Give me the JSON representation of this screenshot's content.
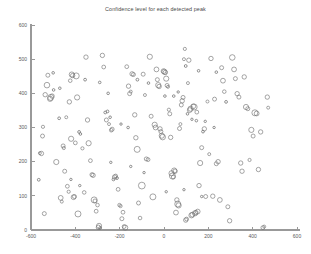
{
  "figure": {
    "title": "Confidence level for each detected peak",
    "background_color": "#ffffff",
    "axis_color": "#999999",
    "marker_color": "#6e6e6e",
    "text_color": "#4a4a4a"
  },
  "chart_data": {
    "type": "scatter",
    "title": "Confidence level for each detected peak",
    "xlabel": "",
    "ylabel": "",
    "xlim": [
      -600,
      600
    ],
    "ylim": [
      0,
      600
    ],
    "xticks": [
      -600,
      -400,
      -200,
      0,
      200,
      400,
      600
    ],
    "yticks": [
      0,
      100,
      200,
      300,
      400,
      500,
      600
    ],
    "xticklabels": [
      "-600",
      "-400",
      "-200",
      "0",
      "200",
      "400",
      "600"
    ],
    "yticklabels": [
      "0",
      "100",
      "200",
      "300",
      "400",
      "500",
      "600"
    ],
    "grid": false,
    "legend": null,
    "marker": "open-circle",
    "size_encodes": "confidence level",
    "size_range": [
      1,
      6
    ],
    "series": [
      {
        "name": "detected peaks",
        "points": [
          {
            "x": -565,
            "y": 147,
            "s": 1.4
          },
          {
            "x": -560,
            "y": 225,
            "s": 1.5
          },
          {
            "x": -553,
            "y": 224,
            "s": 2.2
          },
          {
            "x": -548,
            "y": 275,
            "s": 2.0
          },
          {
            "x": -546,
            "y": 302,
            "s": 1.6
          },
          {
            "x": -540,
            "y": 48,
            "s": 2.0
          },
          {
            "x": -536,
            "y": 396,
            "s": 2.2
          },
          {
            "x": -528,
            "y": 424,
            "s": 2.8
          },
          {
            "x": -524,
            "y": 453,
            "s": 2.0
          },
          {
            "x": -514,
            "y": 384,
            "s": 2.6
          },
          {
            "x": -511,
            "y": 388,
            "s": 3.0
          },
          {
            "x": -505,
            "y": 392,
            "s": 2.2
          },
          {
            "x": -498,
            "y": 410,
            "s": 1.3
          },
          {
            "x": -486,
            "y": 199,
            "s": 2.6
          },
          {
            "x": -473,
            "y": 327,
            "s": 1.4
          },
          {
            "x": -466,
            "y": 94,
            "s": 2.4
          },
          {
            "x": -461,
            "y": 83,
            "s": 1.5
          },
          {
            "x": -455,
            "y": 246,
            "s": 2.0
          },
          {
            "x": -452,
            "y": 240,
            "s": 1.6
          },
          {
            "x": -448,
            "y": 172,
            "s": 2.0
          },
          {
            "x": -441,
            "y": 330,
            "s": 1.5
          },
          {
            "x": -436,
            "y": 128,
            "s": 1.9
          },
          {
            "x": -430,
            "y": 112,
            "s": 1.6
          },
          {
            "x": -427,
            "y": 375,
            "s": 2.2
          },
          {
            "x": -423,
            "y": 437,
            "s": 1.8
          },
          {
            "x": -419,
            "y": 267,
            "s": 2.6
          },
          {
            "x": -416,
            "y": 455,
            "s": 2.6
          },
          {
            "x": -412,
            "y": 452,
            "s": 2.2
          },
          {
            "x": -408,
            "y": 96,
            "s": 2.4
          },
          {
            "x": -404,
            "y": 98,
            "s": 2.0
          },
          {
            "x": -400,
            "y": 255,
            "s": 1.9
          },
          {
            "x": -396,
            "y": 451,
            "s": 3.0
          },
          {
            "x": -392,
            "y": 388,
            "s": 2.6
          },
          {
            "x": -388,
            "y": 47,
            "s": 3.0
          },
          {
            "x": -383,
            "y": 287,
            "s": 1.4
          },
          {
            "x": -377,
            "y": 281,
            "s": 1.3
          },
          {
            "x": -368,
            "y": 239,
            "s": 1.6
          },
          {
            "x": -360,
            "y": 110,
            "s": 1.8
          },
          {
            "x": -352,
            "y": 506,
            "s": 2.2
          },
          {
            "x": -345,
            "y": 322,
            "s": 2.2
          },
          {
            "x": -340,
            "y": 254,
            "s": 2.6
          },
          {
            "x": -332,
            "y": 203,
            "s": 1.9
          },
          {
            "x": -325,
            "y": 162,
            "s": 2.0
          },
          {
            "x": -320,
            "y": 160,
            "s": 2.2
          },
          {
            "x": -315,
            "y": 88,
            "s": 3.0
          },
          {
            "x": -311,
            "y": 85,
            "s": 2.0
          },
          {
            "x": -306,
            "y": 55,
            "s": 1.9
          },
          {
            "x": -300,
            "y": 73,
            "s": 1.8
          },
          {
            "x": -296,
            "y": 8,
            "s": 2.2
          },
          {
            "x": -293,
            "y": 12,
            "s": 2.6
          },
          {
            "x": -288,
            "y": 6,
            "s": 1.4
          },
          {
            "x": -278,
            "y": 511,
            "s": 2.2
          },
          {
            "x": -272,
            "y": 477,
            "s": 1.9
          },
          {
            "x": -265,
            "y": 344,
            "s": 1.4
          },
          {
            "x": -260,
            "y": 322,
            "s": 2.0
          },
          {
            "x": -255,
            "y": 347,
            "s": 1.4
          },
          {
            "x": -248,
            "y": 310,
            "s": 1.5
          },
          {
            "x": -243,
            "y": 330,
            "s": 1.3
          },
          {
            "x": -238,
            "y": 292,
            "s": 1.8
          },
          {
            "x": -234,
            "y": 295,
            "s": 2.0
          },
          {
            "x": -228,
            "y": 148,
            "s": 1.4
          },
          {
            "x": -223,
            "y": 155,
            "s": 2.2
          },
          {
            "x": -218,
            "y": 158,
            "s": 1.9
          },
          {
            "x": -212,
            "y": 152,
            "s": 1.4
          },
          {
            "x": -207,
            "y": 119,
            "s": 1.9
          },
          {
            "x": -201,
            "y": 73,
            "s": 1.7
          },
          {
            "x": -196,
            "y": 70,
            "s": 1.6
          },
          {
            "x": -190,
            "y": 33,
            "s": 2.0
          },
          {
            "x": -185,
            "y": 52,
            "s": 1.9
          },
          {
            "x": -180,
            "y": 10,
            "s": 1.9
          },
          {
            "x": -175,
            "y": 7,
            "s": 2.6
          },
          {
            "x": -168,
            "y": 478,
            "s": 1.9
          },
          {
            "x": -160,
            "y": 421,
            "s": 2.2
          },
          {
            "x": -155,
            "y": 399,
            "s": 2.0
          },
          {
            "x": -150,
            "y": 405,
            "s": 1.5
          },
          {
            "x": -144,
            "y": 457,
            "s": 2.2
          },
          {
            "x": -138,
            "y": 455,
            "s": 2.0
          },
          {
            "x": -132,
            "y": 337,
            "s": 2.2
          },
          {
            "x": -127,
            "y": 270,
            "s": 2.2
          },
          {
            "x": -121,
            "y": 236,
            "s": 3.0
          },
          {
            "x": -115,
            "y": 79,
            "s": 2.0
          },
          {
            "x": -108,
            "y": 35,
            "s": 1.8
          },
          {
            "x": -100,
            "y": 130,
            "s": 3.4
          },
          {
            "x": -94,
            "y": 456,
            "s": 2.0
          },
          {
            "x": -86,
            "y": 395,
            "s": 1.5
          },
          {
            "x": -80,
            "y": 208,
            "s": 2.0
          },
          {
            "x": -72,
            "y": 206,
            "s": 1.9
          },
          {
            "x": -64,
            "y": 507,
            "s": 2.6
          },
          {
            "x": -58,
            "y": 333,
            "s": 2.0
          },
          {
            "x": -50,
            "y": 97,
            "s": 3.0
          },
          {
            "x": -42,
            "y": 308,
            "s": 2.6
          },
          {
            "x": -38,
            "y": 300,
            "s": 2.4
          },
          {
            "x": -34,
            "y": 470,
            "s": 2.4
          },
          {
            "x": -30,
            "y": 440,
            "s": 2.0
          },
          {
            "x": -26,
            "y": 424,
            "s": 2.6
          },
          {
            "x": -22,
            "y": 420,
            "s": 2.2
          },
          {
            "x": -18,
            "y": 296,
            "s": 2.2
          },
          {
            "x": -14,
            "y": 288,
            "s": 2.0
          },
          {
            "x": -10,
            "y": 276,
            "s": 2.6
          },
          {
            "x": -6,
            "y": 272,
            "s": 2.8
          },
          {
            "x": -2,
            "y": 465,
            "s": 2.4
          },
          {
            "x": 2,
            "y": 463,
            "s": 2.6
          },
          {
            "x": 6,
            "y": 461,
            "s": 2.2
          },
          {
            "x": 10,
            "y": 443,
            "s": 2.6
          },
          {
            "x": 14,
            "y": 423,
            "s": 2.0
          },
          {
            "x": 18,
            "y": 419,
            "s": 1.5
          },
          {
            "x": 22,
            "y": 352,
            "s": 1.6
          },
          {
            "x": 26,
            "y": 340,
            "s": 2.0
          },
          {
            "x": 30,
            "y": 271,
            "s": 2.2
          },
          {
            "x": 34,
            "y": 166,
            "s": 2.6
          },
          {
            "x": 38,
            "y": 158,
            "s": 3.0
          },
          {
            "x": 42,
            "y": 155,
            "s": 2.0
          },
          {
            "x": 46,
            "y": 174,
            "s": 2.6
          },
          {
            "x": 50,
            "y": 172,
            "s": 2.2
          },
          {
            "x": 54,
            "y": 51,
            "s": 2.4
          },
          {
            "x": 58,
            "y": 88,
            "s": 2.2
          },
          {
            "x": 62,
            "y": 76,
            "s": 3.0
          },
          {
            "x": 66,
            "y": 72,
            "s": 2.6
          },
          {
            "x": 70,
            "y": 297,
            "s": 2.0
          },
          {
            "x": 74,
            "y": 310,
            "s": 1.5
          },
          {
            "x": 78,
            "y": 366,
            "s": 2.0
          },
          {
            "x": 82,
            "y": 378,
            "s": 2.2
          },
          {
            "x": 86,
            "y": 388,
            "s": 2.0
          },
          {
            "x": 90,
            "y": 500,
            "s": 1.5
          },
          {
            "x": 94,
            "y": 530,
            "s": 1.6
          },
          {
            "x": 98,
            "y": 29,
            "s": 2.2
          },
          {
            "x": 102,
            "y": 32,
            "s": 1.9
          },
          {
            "x": 108,
            "y": 430,
            "s": 1.5
          },
          {
            "x": 112,
            "y": 497,
            "s": 2.2
          },
          {
            "x": 116,
            "y": 351,
            "s": 2.4
          },
          {
            "x": 120,
            "y": 355,
            "s": 2.6
          },
          {
            "x": 124,
            "y": 43,
            "s": 2.6
          },
          {
            "x": 128,
            "y": 45,
            "s": 2.4
          },
          {
            "x": 132,
            "y": 362,
            "s": 2.4
          },
          {
            "x": 136,
            "y": 360,
            "s": 3.0
          },
          {
            "x": 140,
            "y": 49,
            "s": 2.6
          },
          {
            "x": 144,
            "y": 51,
            "s": 2.2
          },
          {
            "x": 148,
            "y": 345,
            "s": 1.9
          },
          {
            "x": 152,
            "y": 54,
            "s": 2.4
          },
          {
            "x": 158,
            "y": 130,
            "s": 2.2
          },
          {
            "x": 163,
            "y": 196,
            "s": 2.6
          },
          {
            "x": 170,
            "y": 241,
            "s": 2.0
          },
          {
            "x": 176,
            "y": 288,
            "s": 1.4
          },
          {
            "x": 182,
            "y": 296,
            "s": 2.2
          },
          {
            "x": 188,
            "y": 98,
            "s": 2.0
          },
          {
            "x": 196,
            "y": 376,
            "s": 1.5
          },
          {
            "x": 204,
            "y": 222,
            "s": 1.5
          },
          {
            "x": 212,
            "y": 502,
            "s": 2.2
          },
          {
            "x": 220,
            "y": 99,
            "s": 2.2
          },
          {
            "x": 228,
            "y": 383,
            "s": 2.0
          },
          {
            "x": 236,
            "y": 194,
            "s": 2.0
          },
          {
            "x": 244,
            "y": 200,
            "s": 2.2
          },
          {
            "x": 252,
            "y": 88,
            "s": 2.4
          },
          {
            "x": 260,
            "y": 475,
            "s": 2.0
          },
          {
            "x": 266,
            "y": 437,
            "s": 2.4
          },
          {
            "x": 272,
            "y": 405,
            "s": 1.8
          },
          {
            "x": 280,
            "y": 375,
            "s": 1.4
          },
          {
            "x": 288,
            "y": 68,
            "s": 2.0
          },
          {
            "x": 296,
            "y": 27,
            "s": 2.2
          },
          {
            "x": 308,
            "y": 505,
            "s": 2.8
          },
          {
            "x": 316,
            "y": 470,
            "s": 2.4
          },
          {
            "x": 322,
            "y": 443,
            "s": 2.0
          },
          {
            "x": 330,
            "y": 399,
            "s": 2.2
          },
          {
            "x": 338,
            "y": 389,
            "s": 2.0
          },
          {
            "x": 346,
            "y": 196,
            "s": 2.2
          },
          {
            "x": 352,
            "y": 172,
            "s": 2.2
          },
          {
            "x": 362,
            "y": 448,
            "s": 2.2
          },
          {
            "x": 370,
            "y": 360,
            "s": 2.6
          },
          {
            "x": 378,
            "y": 355,
            "s": 2.0
          },
          {
            "x": 386,
            "y": 205,
            "s": 1.6
          },
          {
            "x": 394,
            "y": 293,
            "s": 2.6
          },
          {
            "x": 402,
            "y": 275,
            "s": 2.0
          },
          {
            "x": 410,
            "y": 343,
            "s": 3.0
          },
          {
            "x": 418,
            "y": 341,
            "s": 2.4
          },
          {
            "x": 426,
            "y": 177,
            "s": 2.2
          },
          {
            "x": 436,
            "y": 287,
            "s": 2.2
          },
          {
            "x": 446,
            "y": 7,
            "s": 1.9
          },
          {
            "x": 452,
            "y": 10,
            "s": 1.5
          },
          {
            "x": 466,
            "y": 389,
            "s": 2.2
          },
          {
            "x": 470,
            "y": 358,
            "s": 1.5
          },
          {
            "x": -500,
            "y": 460,
            "s": 1.3
          },
          {
            "x": -470,
            "y": 415,
            "s": 1.3
          },
          {
            "x": -356,
            "y": 440,
            "s": 1.4
          },
          {
            "x": -290,
            "y": 432,
            "s": 1.3
          },
          {
            "x": -252,
            "y": 400,
            "s": 1.3
          },
          {
            "x": -194,
            "y": 310,
            "s": 1.2
          },
          {
            "x": -162,
            "y": 300,
            "s": 1.3
          },
          {
            "x": -120,
            "y": 440,
            "s": 1.4
          },
          {
            "x": -70,
            "y": 430,
            "s": 1.3
          },
          {
            "x": 4,
            "y": 392,
            "s": 1.3
          },
          {
            "x": 44,
            "y": 392,
            "s": 1.3
          },
          {
            "x": 64,
            "y": 404,
            "s": 1.2
          },
          {
            "x": 106,
            "y": 340,
            "s": 1.3
          },
          {
            "x": 126,
            "y": 324,
            "s": 1.2
          },
          {
            "x": 146,
            "y": 320,
            "s": 1.3
          },
          {
            "x": 186,
            "y": 318,
            "s": 1.2
          },
          {
            "x": 226,
            "y": 300,
            "s": 1.2
          },
          {
            "x": 98,
            "y": 480,
            "s": 1.4
          },
          {
            "x": 156,
            "y": 466,
            "s": 1.3
          },
          {
            "x": 236,
            "y": 462,
            "s": 1.3
          },
          {
            "x": -420,
            "y": 148,
            "s": 1.2
          },
          {
            "x": -380,
            "y": 130,
            "s": 1.2
          },
          {
            "x": -240,
            "y": 198,
            "s": 1.2
          },
          {
            "x": -150,
            "y": 186,
            "s": 1.2
          },
          {
            "x": -90,
            "y": 168,
            "s": 1.2
          },
          {
            "x": 10,
            "y": 112,
            "s": 1.2
          },
          {
            "x": 90,
            "y": 118,
            "s": 1.2
          },
          {
            "x": 170,
            "y": 98,
            "s": 1.2
          }
        ]
      }
    ]
  }
}
